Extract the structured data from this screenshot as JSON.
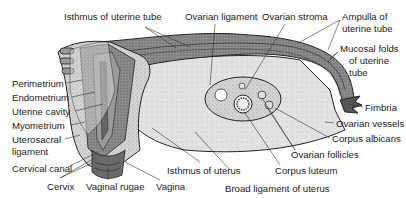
{
  "diagram": {
    "labels": [
      {
        "id": "isthmus-uterine-tube",
        "text": "Isthmus of uterine tube",
        "x": 64,
        "y": 12
      },
      {
        "id": "ovarian-ligament",
        "text": "Ovarian ligament",
        "x": 185,
        "y": 12
      },
      {
        "id": "ovarian-stroma",
        "text": "Ovarian stroma",
        "x": 262,
        "y": 12
      },
      {
        "id": "ampulla-line1",
        "text": "Ampulla of",
        "x": 342,
        "y": 12
      },
      {
        "id": "ampulla-line2",
        "text": "uterine tube",
        "x": 342,
        "y": 24
      },
      {
        "id": "mucosal-line1",
        "text": "Mucosal folds",
        "x": 340,
        "y": 44
      },
      {
        "id": "mucosal-line2",
        "text": "of uterine",
        "x": 349,
        "y": 56
      },
      {
        "id": "mucosal-line3",
        "text": "tube",
        "x": 349,
        "y": 68
      },
      {
        "id": "perimetrium",
        "text": "Perimetrium",
        "x": 12,
        "y": 79
      },
      {
        "id": "endometrium",
        "text": "Endometrium",
        "x": 12,
        "y": 93
      },
      {
        "id": "uterine-cavity",
        "text": "Uterine cavity",
        "x": 12,
        "y": 107
      },
      {
        "id": "myometrium",
        "text": "Myometrium",
        "x": 12,
        "y": 121
      },
      {
        "id": "uterosacral-line1",
        "text": "Uterosacral",
        "x": 12,
        "y": 135
      },
      {
        "id": "uterosacral-line2",
        "text": "ligament",
        "x": 12,
        "y": 147
      },
      {
        "id": "fimbria",
        "text": "Fimbria",
        "x": 365,
        "y": 103
      },
      {
        "id": "ovarian-vessels",
        "text": "Ovarian vessels",
        "x": 336,
        "y": 119
      },
      {
        "id": "corpus-albicans",
        "text": "Corpus albicans",
        "x": 332,
        "y": 134
      },
      {
        "id": "ovarian-follicles",
        "text": "Ovarian follicles",
        "x": 291,
        "y": 150
      },
      {
        "id": "cervical-canal",
        "text": "Cervical canal",
        "x": 12,
        "y": 164
      },
      {
        "id": "isthmus-uterus",
        "text": "Isthmus of uterus",
        "x": 167,
        "y": 166
      },
      {
        "id": "corpus-luteum",
        "text": "Corpus luteum",
        "x": 275,
        "y": 166
      },
      {
        "id": "cervix",
        "text": "Cervix",
        "x": 47,
        "y": 182
      },
      {
        "id": "vaginal-rugae",
        "text": "Vaginal rugae",
        "x": 86,
        "y": 182
      },
      {
        "id": "vagina",
        "text": "Vagina",
        "x": 156,
        "y": 182
      },
      {
        "id": "broad-ligament",
        "text": "Broad ligament of uterus",
        "x": 225,
        "y": 184
      }
    ],
    "colors": {
      "tissue_light": "#d6d6d6",
      "tissue_mid": "#a8a8a8",
      "tissue_dark": "#5a5a5a",
      "outline": "#222222",
      "leader": "#333333",
      "background": "#ffffff"
    }
  }
}
